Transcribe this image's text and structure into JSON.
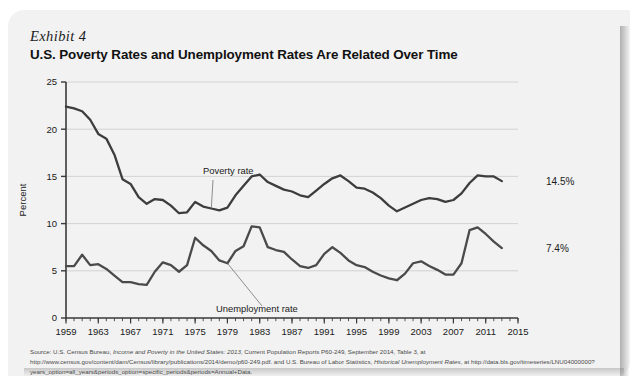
{
  "card": {
    "exhibit_label": "Exhibit 4",
    "title": "U.S. Poverty Rates and Unemployment Rates Are Related Over Time"
  },
  "source": {
    "line1_a": "Source: U.S. Census Bureau, ",
    "line1_i": "Income and Poverty in the United States: 2013",
    "line1_b": ", Current Population Reports P60-249, September 2014, Table 3, at http://www.census.gov/content/dam",
    "line2_a": "/Census/library/publications/2014/demo/p60-249.pdf. and U.S. Bureau of Labor Statistics, ",
    "line2_i": "Historical Unemployment Rates",
    "line2_b": ", at http://data.bls.gov/timeseries/LNU04000000?years",
    "line3": "_option=all_years&periods_option=specific_periods&periods=Annual+Data."
  },
  "chart_data": {
    "type": "line",
    "title": "U.S. Poverty Rates and Unemployment Rates Are Related Over Time",
    "xlabel": "",
    "ylabel": "Percent",
    "ylim": [
      0,
      25
    ],
    "yticks": [
      0,
      5,
      10,
      15,
      20,
      25
    ],
    "ytick_labels": [
      "0",
      "5",
      "10",
      "15",
      "20",
      "25"
    ],
    "xlim": [
      1959,
      2015
    ],
    "xticks": [
      1959,
      1963,
      1967,
      1971,
      1975,
      1979,
      1983,
      1987,
      1991,
      1995,
      1999,
      2003,
      2007,
      2011,
      2015
    ],
    "xtick_labels": [
      "1959",
      "1963",
      "1967",
      "1971",
      "1975",
      "1979",
      "1983",
      "1987",
      "1991",
      "1995",
      "1999",
      "2003",
      "2007",
      "2011",
      "2015"
    ],
    "minor_xticks_every": 1,
    "grid": "horizontal",
    "legend_position": "inline-annotations",
    "annotations": [
      {
        "text": "Poverty rate",
        "series": "Poverty rate",
        "at_year": 1977
      },
      {
        "text": "Unemployment  rate",
        "series": "Unemployment rate",
        "at_year": 1979
      }
    ],
    "endpoint_labels": [
      {
        "series": "Poverty rate",
        "value": 14.5,
        "text": "14.5%"
      },
      {
        "series": "Unemployment rate",
        "value": 7.4,
        "text": "7.4%"
      }
    ],
    "x": [
      1959,
      1960,
      1961,
      1962,
      1963,
      1964,
      1965,
      1966,
      1967,
      1968,
      1969,
      1970,
      1971,
      1972,
      1973,
      1974,
      1975,
      1976,
      1977,
      1978,
      1979,
      1980,
      1981,
      1982,
      1983,
      1984,
      1985,
      1986,
      1987,
      1988,
      1989,
      1990,
      1991,
      1992,
      1993,
      1994,
      1995,
      1996,
      1997,
      1998,
      1999,
      2000,
      2001,
      2002,
      2003,
      2004,
      2005,
      2006,
      2007,
      2008,
      2009,
      2010,
      2011,
      2012,
      2013
    ],
    "series": [
      {
        "name": "Poverty rate",
        "color": "#3d3d3d",
        "values": [
          22.4,
          22.2,
          21.9,
          21.0,
          19.5,
          19.0,
          17.3,
          14.7,
          14.2,
          12.8,
          12.1,
          12.6,
          12.5,
          11.9,
          11.1,
          11.2,
          12.3,
          11.8,
          11.6,
          11.4,
          11.7,
          13.0,
          14.0,
          15.0,
          15.2,
          14.4,
          14.0,
          13.6,
          13.4,
          13.0,
          12.8,
          13.5,
          14.2,
          14.8,
          15.1,
          14.5,
          13.8,
          13.7,
          13.3,
          12.7,
          11.9,
          11.3,
          11.7,
          12.1,
          12.5,
          12.7,
          12.6,
          12.3,
          12.5,
          13.2,
          14.3,
          15.1,
          15.0,
          15.0,
          14.5
        ]
      },
      {
        "name": "Unemployment rate",
        "color": "#4a4a4a",
        "values": [
          5.5,
          5.5,
          6.7,
          5.6,
          5.7,
          5.2,
          4.5,
          3.8,
          3.8,
          3.6,
          3.5,
          4.9,
          5.9,
          5.6,
          4.9,
          5.6,
          8.5,
          7.7,
          7.1,
          6.1,
          5.8,
          7.1,
          7.6,
          9.7,
          9.6,
          7.5,
          7.2,
          7.0,
          6.2,
          5.5,
          5.3,
          5.6,
          6.8,
          7.5,
          6.9,
          6.1,
          5.6,
          5.4,
          4.9,
          4.5,
          4.2,
          4.0,
          4.7,
          5.8,
          6.0,
          5.5,
          5.1,
          4.6,
          4.6,
          5.8,
          9.3,
          9.6,
          8.9,
          8.1,
          7.4
        ]
      }
    ]
  }
}
